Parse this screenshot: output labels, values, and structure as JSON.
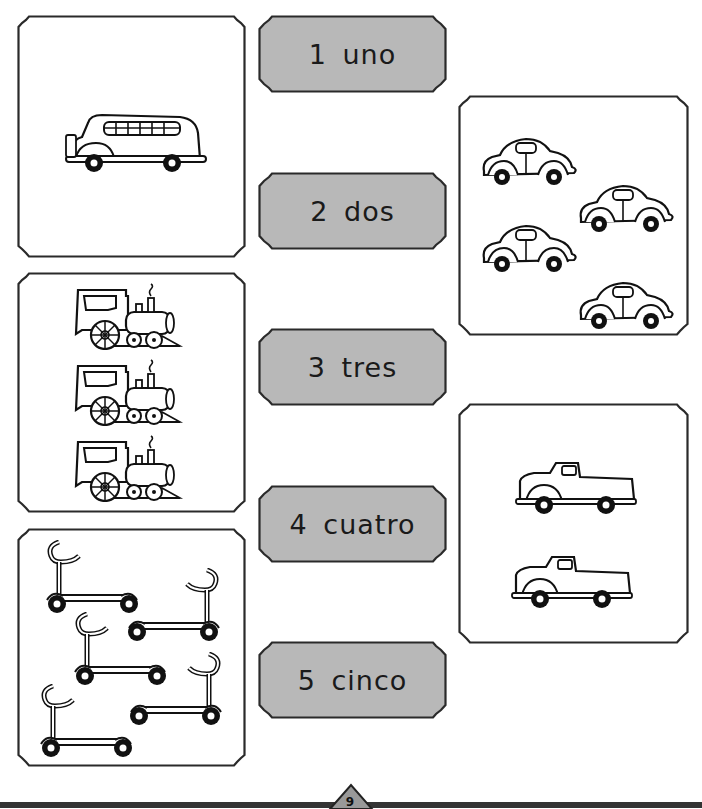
{
  "worksheet": {
    "number_labels": [
      {
        "numeral": "1",
        "word": "uno",
        "text": "1 uno"
      },
      {
        "numeral": "2",
        "word": "dos",
        "text": "2 dos"
      },
      {
        "numeral": "3",
        "word": "tres",
        "text": "3 tres"
      },
      {
        "numeral": "4",
        "word": "cuatro",
        "text": "4 cuatro"
      },
      {
        "numeral": "5",
        "word": "cinco",
        "text": "5 cinco"
      }
    ],
    "picture_boxes": [
      {
        "id": "bus",
        "object": "school bus",
        "count": 1,
        "position": "left-top"
      },
      {
        "id": "trains",
        "object": "steam locomotive",
        "count": 3,
        "position": "left-middle"
      },
      {
        "id": "scooters",
        "object": "scooter",
        "count": 5,
        "position": "left-bottom"
      },
      {
        "id": "cars",
        "object": "car",
        "count": 4,
        "position": "right-top"
      },
      {
        "id": "trucks",
        "object": "pickup truck",
        "count": 2,
        "position": "right-bottom"
      }
    ],
    "colors": {
      "label_fill": "#b8b8b8",
      "border": "#2a2a2a",
      "background": "#ffffff"
    }
  },
  "footer": {
    "page_number": "9"
  }
}
